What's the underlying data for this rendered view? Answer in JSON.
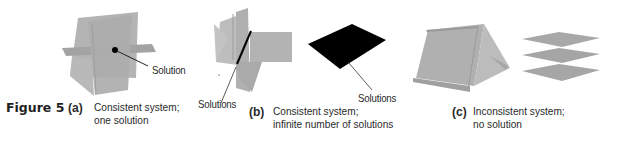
{
  "figure": {
    "number_label": "Figure 5",
    "colors": {
      "plane_gray": "#a9a9a9",
      "plane_light": "#bdbdbd",
      "plane_dark": "#959595",
      "solution_black": "#000000",
      "text": "#2a2a2a"
    },
    "panels": [
      {
        "letter": "(a)",
        "caption_line1": "Consistent system;",
        "caption_line2": "one solution",
        "annotation": "Solution"
      },
      {
        "letter": "(b)",
        "caption_line1": "Consistent system;",
        "caption_line2": "infinite number of solutions",
        "annotation_left": "Solutions",
        "annotation_right": "Solutions"
      },
      {
        "letter": "(c)",
        "caption_line1": "Inconsistent system;",
        "caption_line2": "no solution"
      }
    ]
  }
}
